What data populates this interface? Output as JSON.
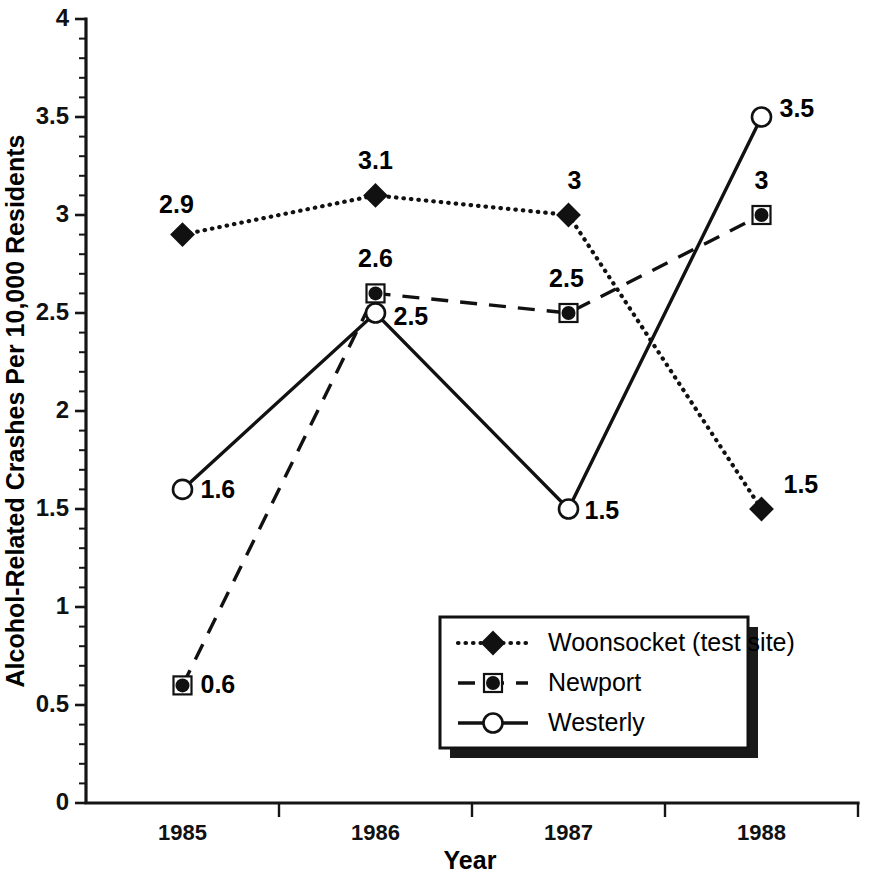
{
  "chart_data": {
    "type": "line",
    "title": "",
    "xlabel": "Year",
    "ylabel": "Alcohol-Related Crashes Per 10,000 Residents",
    "categories": [
      "1985",
      "1986",
      "1987",
      "1988"
    ],
    "x": [
      1985,
      1986,
      1987,
      1988
    ],
    "ylim": [
      0,
      4
    ],
    "xlim_categories": 4,
    "grid": false,
    "legend_position": "lower-right-inside",
    "y_major_ticks": [
      "0",
      "0.5",
      "1",
      "1.5",
      "2",
      "2.5",
      "3",
      "3.5",
      "4"
    ],
    "y_major_tick_values": [
      0,
      0.5,
      1,
      1.5,
      2,
      2.5,
      3,
      3.5,
      4
    ],
    "y_minor_tick_step": 0.1,
    "series": [
      {
        "name": "Woonsocket (test site)",
        "marker": "diamond",
        "line_style": "dotted",
        "color": "#111111",
        "values": [
          2.9,
          3.1,
          3,
          1.5
        ],
        "point_labels": [
          "2.9",
          "3.1",
          "3",
          "1.5"
        ],
        "label_offsets": [
          {
            "dx": -6,
            "dy": -22,
            "anchor": "middle"
          },
          {
            "dx": 0,
            "dy": -26,
            "anchor": "middle"
          },
          {
            "dx": 6,
            "dy": -26,
            "anchor": "middle"
          },
          {
            "dx": 22,
            "dy": -16,
            "anchor": "start"
          }
        ]
      },
      {
        "name": "Newport",
        "marker": "square",
        "line_style": "dashed",
        "color": "#111111",
        "values": [
          0.6,
          2.6,
          2.5,
          3
        ],
        "point_labels": [
          "0.6",
          "2.6",
          "2.5",
          "3"
        ],
        "label_offsets": [
          {
            "dx": 18,
            "dy": 8,
            "anchor": "start"
          },
          {
            "dx": 0,
            "dy": -26,
            "anchor": "middle"
          },
          {
            "dx": -2,
            "dy": -26,
            "anchor": "middle"
          },
          {
            "dx": 0,
            "dy": -26,
            "anchor": "middle"
          }
        ]
      },
      {
        "name": "Westerly",
        "marker": "circle",
        "line_style": "solid",
        "color": "#111111",
        "values": [
          1.6,
          2.5,
          1.5,
          3.5
        ],
        "point_labels": [
          "1.6",
          "2.5",
          "1.5",
          "3.5"
        ],
        "label_offsets": [
          {
            "dx": 18,
            "dy": 9,
            "anchor": "start"
          },
          {
            "dx": 18,
            "dy": 12,
            "anchor": "start"
          },
          {
            "dx": 16,
            "dy": 10,
            "anchor": "start"
          },
          {
            "dx": 18,
            "dy": 0,
            "anchor": "start"
          }
        ]
      }
    ],
    "legend_entries": [
      {
        "label": "Woonsocket (test site)",
        "marker": "diamond",
        "line_style": "dotted"
      },
      {
        "label": "Newport",
        "marker": "square",
        "line_style": "dashed"
      },
      {
        "label": "Westerly",
        "marker": "circle",
        "line_style": "solid"
      }
    ]
  },
  "colors": {
    "ink": "#111111",
    "background": "#ffffff",
    "shadow": "#1a1a1a"
  }
}
